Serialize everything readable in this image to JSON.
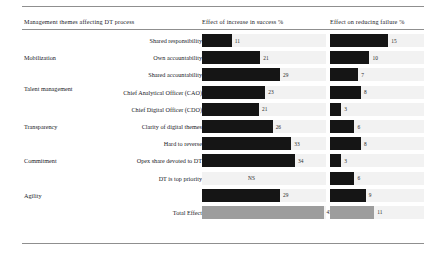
{
  "header": {
    "themes_label": "Management themes affecting DT process",
    "success_label": "Effect of increase in success %",
    "failure_label": "Effect on reducing failure %"
  },
  "chart_data": {
    "type": "bar",
    "title": "Management themes affecting DT process",
    "xlabel": "",
    "ylabel": "",
    "orientation": "horizontal",
    "grid": false,
    "legend": "none",
    "series": [
      {
        "name": "Effect of increase in success %",
        "values": [
          11,
          21,
          29,
          23,
          21,
          26,
          33,
          34,
          null,
          29,
          45
        ]
      },
      {
        "name": "Effect on reducing failure %",
        "values": [
          15,
          10,
          7,
          8,
          3,
          6,
          8,
          3,
          6,
          9,
          11
        ]
      }
    ],
    "categories": [
      "Shared responsibility",
      "Own accountability",
      "Shared accountability",
      "Chief Analytical Officer (CAO)",
      "Chief Digital Officer (CDO)",
      "Clarity of digital themes",
      "Hard to reverse",
      "Opex share devoted to DT",
      "DT is top priority",
      "",
      "Total Effect"
    ],
    "groups": [
      "Mobilization",
      "Talent management",
      "Transparency",
      "Commitment",
      "Agility"
    ],
    "not_significant_label": "NS",
    "xlim_success": [
      0,
      50
    ],
    "xlim_failure": [
      0,
      18
    ],
    "colors": {
      "bar": "#151515",
      "total_bar": "#9d9d9d",
      "track": "#f2f2f2",
      "rule": "#8f8f8f"
    }
  },
  "rows": [
    {
      "group": "",
      "item": "Shared responsibility",
      "success": "11",
      "success_pct": 24,
      "failure": "15",
      "failure_pct": 62,
      "total": false
    },
    {
      "group": "Mobilization",
      "item": "Own accountability",
      "success": "21",
      "success_pct": 47,
      "failure": "10",
      "failure_pct": 42,
      "total": false
    },
    {
      "group": "",
      "item": "Shared accountability",
      "success": "29",
      "success_pct": 63,
      "failure": "7",
      "failure_pct": 30,
      "total": false
    },
    {
      "group": "Talent management",
      "item": "Chief Analytical Officer (CAO)",
      "success": "23",
      "success_pct": 51,
      "failure": "8",
      "failure_pct": 33,
      "total": false
    },
    {
      "group": "",
      "item": "Chief Digital Officer (CDO)",
      "success": "21",
      "success_pct": 46,
      "failure": "3",
      "failure_pct": 12,
      "total": false
    },
    {
      "group": "Transparency",
      "item": "Clarity of digital themes",
      "success": "26",
      "success_pct": 57,
      "failure": "6",
      "failure_pct": 26,
      "total": false
    },
    {
      "group": "",
      "item": "Hard to reverse",
      "success": "33",
      "success_pct": 72,
      "failure": "8",
      "failure_pct": 33,
      "total": false
    },
    {
      "group": "Commitment",
      "item": "Opex share devoted to DT",
      "success": "34",
      "success_pct": 75,
      "failure": "3",
      "failure_pct": 12,
      "total": false
    },
    {
      "group": "",
      "item": "DT is top priority",
      "success": "NS",
      "success_pct": 0,
      "failure": "6",
      "failure_pct": 26,
      "total": false
    },
    {
      "group": "Agility",
      "item": "",
      "success": "29",
      "success_pct": 63,
      "failure": "9",
      "failure_pct": 38,
      "total": false
    },
    {
      "group": "",
      "item": "Total Effect",
      "success": "45",
      "success_pct": 98,
      "failure": "11",
      "failure_pct": 47,
      "total": true
    }
  ]
}
